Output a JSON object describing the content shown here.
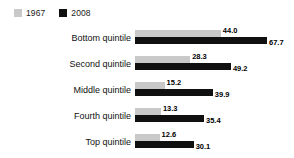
{
  "legend": {
    "entries": [
      {
        "label": "1967",
        "color": "#c9c9c9",
        "swatch_icon": "square-swatch-icon"
      },
      {
        "label": "2008",
        "color": "#101010",
        "swatch_icon": "square-swatch-icon"
      }
    ]
  },
  "chart_data": {
    "type": "bar",
    "orientation": "horizontal",
    "title": "",
    "subtitle": "",
    "xlabel": "",
    "ylabel": "",
    "grid": false,
    "legend_position": "top-left",
    "xlim": [
      0,
      67.7
    ],
    "categories": [
      "Bottom quintile",
      "Second quintile",
      "Middle quintile",
      "Fourth quintile",
      "Top quintile"
    ],
    "series": [
      {
        "name": "1967",
        "color": "#c9c9c9",
        "values": [
          44.0,
          28.3,
          15.2,
          13.3,
          12.6
        ],
        "labels": [
          "44.0",
          "28.3",
          "15.2",
          "13.3",
          "12.6"
        ]
      },
      {
        "name": "2008",
        "color": "#101010",
        "values": [
          67.7,
          49.2,
          39.9,
          35.4,
          30.1
        ],
        "labels": [
          "67.7",
          "49.2",
          "39.9",
          "35.4",
          "30.1"
        ]
      }
    ]
  },
  "scale": {
    "px_per_unit": 1.95
  }
}
